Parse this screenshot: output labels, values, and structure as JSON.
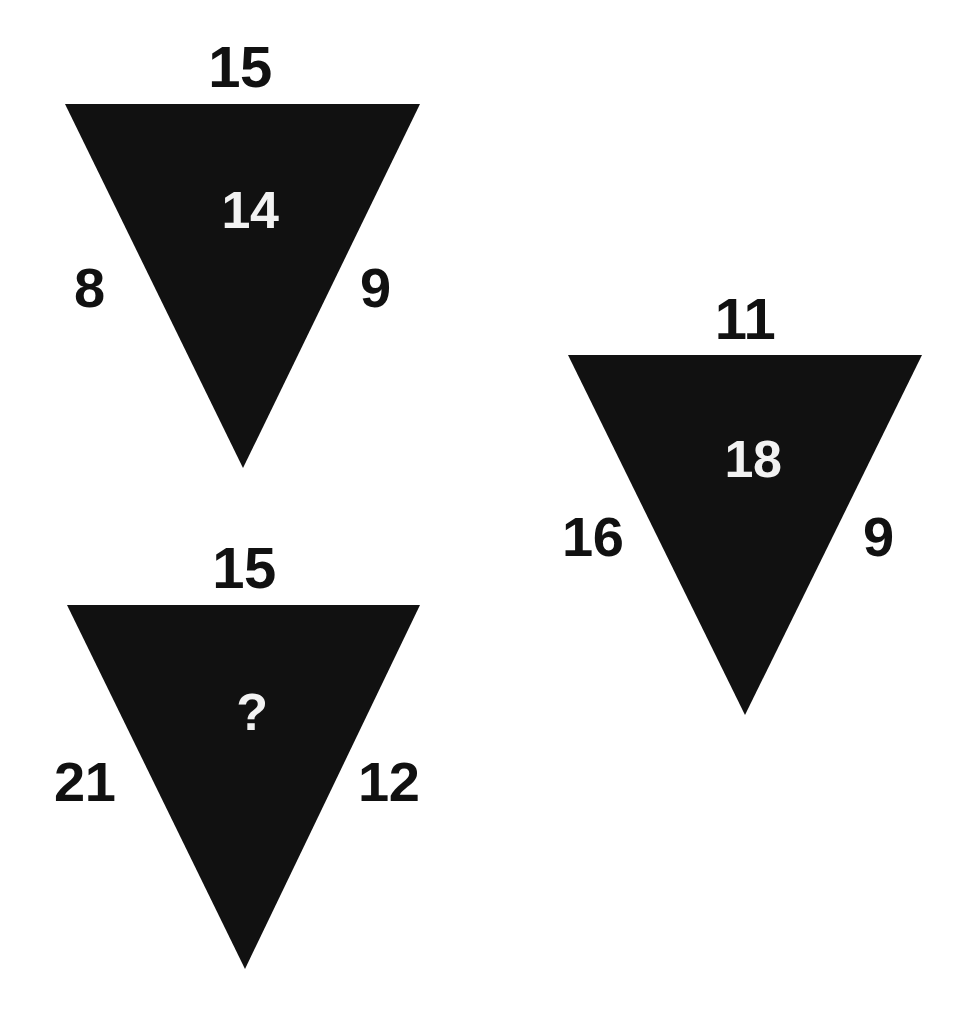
{
  "page": {
    "background_color": "#ffffff",
    "shape_color": "#111111",
    "inner_label_color": "#f2f2f2",
    "outer_label_color": "#111111",
    "width": 953,
    "height": 1030
  },
  "puzzle": {
    "type": "triangle-number-puzzle",
    "shape": "inverted-triangle",
    "unknown_marker": "?",
    "triangles": [
      {
        "id": "triangle-1",
        "position": "top-left",
        "top": "15",
        "left": "8",
        "right": "9",
        "center": "14",
        "center_is_unknown": false
      },
      {
        "id": "triangle-2",
        "position": "right",
        "top": "11",
        "left": "16",
        "right": "9",
        "center": "18",
        "center_is_unknown": false
      },
      {
        "id": "triangle-3",
        "position": "bottom-left",
        "top": "15",
        "left": "21",
        "right": "12",
        "center": "?",
        "center_is_unknown": true
      }
    ]
  }
}
